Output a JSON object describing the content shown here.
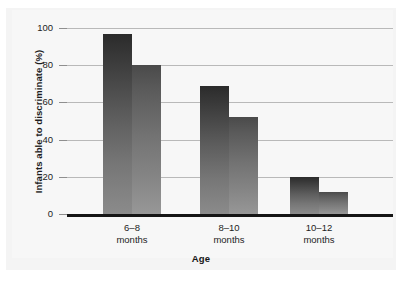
{
  "chart_data": {
    "type": "bar",
    "title": "",
    "subtitle": "",
    "xlabel": "Age",
    "ylabel": "Infants able to discriminate (%)",
    "categories": [
      "6–8\nmonths",
      "8–10\nmonths",
      "10–12\nmonths"
    ],
    "category_lines": [
      {
        "line1": "6–8",
        "line2": "months"
      },
      {
        "line1": "8–10",
        "line2": "months"
      },
      {
        "line1": "10–12",
        "line2": "months"
      }
    ],
    "series": [
      {
        "name": "series-1",
        "values": [
          97,
          69,
          20
        ]
      },
      {
        "name": "series-2",
        "values": [
          80,
          52,
          12
        ]
      }
    ],
    "ylim": [
      0,
      100
    ],
    "yticks": [
      0,
      20,
      40,
      60,
      80,
      100
    ],
    "ytick_labels": [
      "0",
      "20",
      "40",
      "60",
      "80",
      "100"
    ],
    "grid": "horizontal",
    "legend": "none",
    "colors": {
      "series1_top": "#2b2b2b",
      "series1_bottom": "#8b8b8b",
      "series2_top": "#4a4a4a",
      "series2_bottom": "#979797",
      "gridline": "#b9b9b9",
      "axis": "#151515",
      "background": "#f7f7f7",
      "text": "#1d1d1d"
    }
  }
}
